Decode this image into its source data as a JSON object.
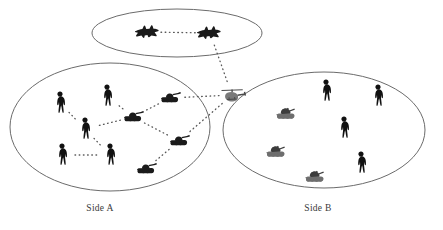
{
  "figure": {
    "background_color": "#ffffff",
    "line_color": "#6b6b6b",
    "link_color": "#5a5a5a",
    "label_color": "#3a3a3a",
    "width": 443,
    "height": 230
  },
  "groups": [
    {
      "id": "air-group",
      "label": "",
      "shape": "ellipse",
      "cx": 177,
      "cy": 33,
      "rx": 85,
      "ry": 24,
      "member_count": 2
    },
    {
      "id": "side-a",
      "label": "Side A",
      "label_x": 100,
      "label_y": 211,
      "shape": "ellipse",
      "cx": 110,
      "cy": 127,
      "rx": 100,
      "ry": 64,
      "member_count": 9
    },
    {
      "id": "side-b",
      "label": "Side B",
      "label_x": 318,
      "label_y": 211,
      "shape": "ellipse",
      "cx": 324,
      "cy": 130,
      "rx": 101,
      "ry": 58,
      "member_count": 7
    }
  ],
  "units": [
    {
      "id": "jet-1",
      "type": "jet",
      "group": "air-group",
      "x": 148,
      "y": 32,
      "scale": 1.0
    },
    {
      "id": "jet-2",
      "type": "jet",
      "group": "air-group",
      "x": 210,
      "y": 33,
      "scale": 1.0
    },
    {
      "id": "heli-1",
      "type": "helicopter",
      "group": "none",
      "x": 232,
      "y": 95,
      "scale": 1.0
    },
    {
      "id": "a-sold-1",
      "type": "soldier",
      "group": "side-a",
      "x": 60,
      "y": 103,
      "scale": 1.0
    },
    {
      "id": "a-sold-2",
      "type": "soldier",
      "group": "side-a",
      "x": 107,
      "y": 96,
      "scale": 1.0
    },
    {
      "id": "a-sold-3",
      "type": "soldier",
      "group": "side-a",
      "x": 85,
      "y": 129,
      "scale": 1.0
    },
    {
      "id": "a-sold-4",
      "type": "soldier",
      "group": "side-a",
      "x": 62,
      "y": 155,
      "scale": 1.0
    },
    {
      "id": "a-sold-5",
      "type": "soldier",
      "group": "side-a",
      "x": 110,
      "y": 155,
      "scale": 1.0
    },
    {
      "id": "a-tank-1",
      "type": "tank",
      "group": "side-a",
      "x": 170,
      "y": 98,
      "scale": 1.0
    },
    {
      "id": "a-tank-2",
      "type": "tank",
      "group": "side-a",
      "x": 133,
      "y": 117,
      "scale": 1.0
    },
    {
      "id": "a-tank-3",
      "type": "tank",
      "group": "side-a",
      "x": 179,
      "y": 141,
      "scale": 1.0
    },
    {
      "id": "a-tank-4",
      "type": "tank",
      "group": "side-a",
      "x": 146,
      "y": 169,
      "scale": 1.0
    },
    {
      "id": "b-sold-1",
      "type": "soldier",
      "group": "side-b",
      "x": 326,
      "y": 91,
      "scale": 1.0
    },
    {
      "id": "b-sold-2",
      "type": "soldier",
      "group": "side-b",
      "x": 378,
      "y": 96,
      "scale": 1.0
    },
    {
      "id": "b-sold-3",
      "type": "soldier",
      "group": "side-b",
      "x": 344,
      "y": 128,
      "scale": 1.0
    },
    {
      "id": "b-sold-4",
      "type": "soldier",
      "group": "side-b",
      "x": 361,
      "y": 163,
      "scale": 1.0
    },
    {
      "id": "b-art-1",
      "type": "artillery",
      "group": "side-b",
      "x": 286,
      "y": 114,
      "scale": 1.0
    },
    {
      "id": "b-art-2",
      "type": "artillery",
      "group": "side-b",
      "x": 276,
      "y": 152,
      "scale": 1.0
    },
    {
      "id": "b-art-3",
      "type": "artillery",
      "group": "side-b",
      "x": 315,
      "y": 177,
      "scale": 1.0
    }
  ],
  "links": [
    {
      "id": "lnk-jet",
      "from": "jet-1",
      "to": "jet-2"
    },
    {
      "id": "lnk-jet-heli",
      "from": "jet-2",
      "to": "heli-1"
    },
    {
      "id": "lnk-heli-t1",
      "from": "heli-1",
      "to": "a-tank-1"
    },
    {
      "id": "lnk-heli-t3",
      "from": "heli-1",
      "to": "a-tank-3"
    },
    {
      "id": "lnk-t1-t2",
      "from": "a-tank-1",
      "to": "a-tank-2"
    },
    {
      "id": "lnk-t2-t3",
      "from": "a-tank-2",
      "to": "a-tank-3"
    },
    {
      "id": "lnk-t3-t4",
      "from": "a-tank-3",
      "to": "a-tank-4"
    },
    {
      "id": "lnk-t2-s2",
      "from": "a-tank-2",
      "to": "a-sold-2"
    },
    {
      "id": "lnk-t2-s3",
      "from": "a-tank-2",
      "to": "a-sold-3"
    },
    {
      "id": "lnk-s1-s3",
      "from": "a-sold-1",
      "to": "a-sold-3"
    },
    {
      "id": "lnk-s3-s5",
      "from": "a-sold-3",
      "to": "a-sold-5"
    },
    {
      "id": "lnk-s4-s5",
      "from": "a-sold-4",
      "to": "a-sold-5"
    }
  ]
}
